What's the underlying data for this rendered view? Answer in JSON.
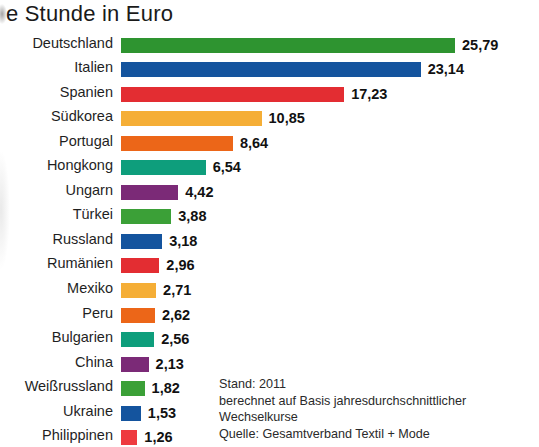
{
  "chart_data": {
    "type": "bar",
    "orientation": "horizontal",
    "title": "e Stunde in Euro",
    "xlabel": "",
    "ylabel": "",
    "xlim": [
      0,
      25.79
    ],
    "grid": false,
    "legend": null,
    "value_format": "de-DE decimal comma",
    "categories": [
      "Deutschland",
      "Italien",
      "Spanien",
      "Südkorea",
      "Portugal",
      "Hongkong",
      "Ungarn",
      "Türkei",
      "Russland",
      "Rumänien",
      "Mexiko",
      "Peru",
      "Bulgarien",
      "China",
      "Weißrussland",
      "Ukraine",
      "Philippinen"
    ],
    "values": [
      25.79,
      23.14,
      17.23,
      10.85,
      8.64,
      6.54,
      4.42,
      3.88,
      3.18,
      2.96,
      2.71,
      2.62,
      2.56,
      2.13,
      1.82,
      1.53,
      1.26
    ],
    "value_labels": [
      "25,79",
      "23,14",
      "17,23",
      "10,85",
      "8,64",
      "6,54",
      "4,42",
      "3,88",
      "3,18",
      "2,96",
      "2,71",
      "2,62",
      "2,56",
      "2,13",
      "1,82",
      "1,53",
      "1,26"
    ],
    "bar_colors": [
      "#2e9430",
      "#14549e",
      "#e32d32",
      "#f5ae36",
      "#ec6618",
      "#0e9e7c",
      "#7b2a77",
      "#3ba037",
      "#14549e",
      "#e32d32",
      "#f5ae36",
      "#ec6618",
      "#0e9e7c",
      "#7b2a77",
      "#3ba037",
      "#14549e",
      "#ee3a3f"
    ]
  },
  "footnote": {
    "line1": "Stand: 2011",
    "line2": "berechnet auf Basis jahresdurchschnittlicher",
    "line3": "Wechselkurse",
    "line4": "Quelle: Gesamtverband Textil + Mode"
  }
}
